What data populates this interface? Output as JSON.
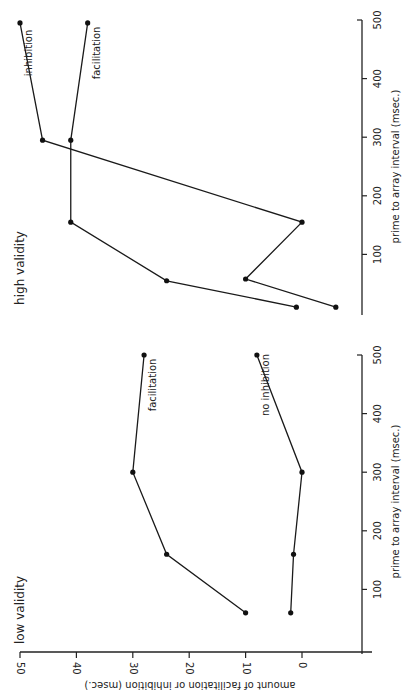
{
  "figure": {
    "orientation": "rotated 90° counter-clockwise",
    "ylabel": "amount of facilitation or inhibition (msec.)",
    "xlabel": "prime to array interval (msec.)",
    "y_ticks": [
      "50",
      "40",
      "30",
      "20",
      "10",
      "0"
    ],
    "x_ticks": [
      "100",
      "200",
      "300",
      "400",
      "500"
    ]
  },
  "chart_data": [
    {
      "type": "line",
      "title": "low validity",
      "xlabel": "prime to array interval (msec.)",
      "ylabel": "amount of facilitation or inhibition (msec.)",
      "xlim": [
        0,
        500
      ],
      "ylim": [
        -10,
        50
      ],
      "x_ticks": [
        100,
        200,
        300,
        400,
        500
      ],
      "y_ticks": [
        0,
        10,
        20,
        30,
        40,
        50
      ],
      "grid": false,
      "series": [
        {
          "name": "facilitation",
          "x": [
            60,
            160,
            300,
            500
          ],
          "values": [
            10,
            24,
            30,
            28
          ]
        },
        {
          "name": "no inhibition",
          "x": [
            60,
            160,
            300,
            500
          ],
          "values": [
            2,
            1.5,
            0,
            8
          ]
        }
      ]
    },
    {
      "type": "line",
      "title": "high validity",
      "xlabel": "prime to array interval (msec.)",
      "ylabel": "amount of facilitation or inhibition (msec.)",
      "xlim": [
        0,
        500
      ],
      "ylim": [
        -10,
        50
      ],
      "x_ticks": [
        100,
        200,
        300,
        400,
        500
      ],
      "y_ticks": [
        0,
        10,
        20,
        30,
        40,
        50
      ],
      "grid": false,
      "series": [
        {
          "name": "facilitation",
          "x": [
            10,
            55,
            155,
            295,
            495
          ],
          "values": [
            1,
            24,
            41,
            41,
            38
          ]
        },
        {
          "name": "inhibition",
          "x": [
            10,
            58,
            155,
            295,
            495
          ],
          "values": [
            -6,
            10,
            0,
            46,
            50
          ]
        }
      ]
    }
  ]
}
